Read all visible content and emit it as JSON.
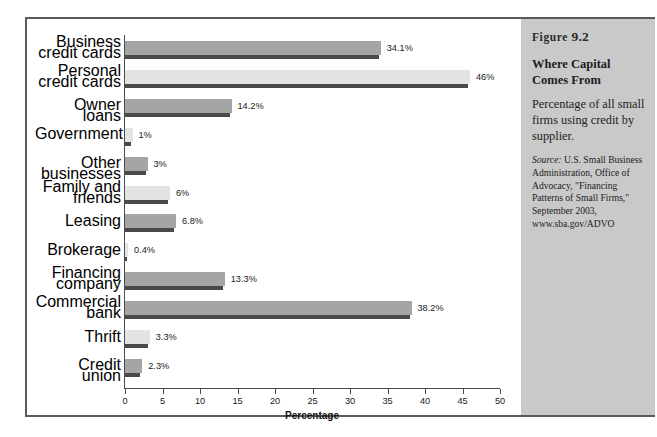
{
  "figure": {
    "number_word": "Figure",
    "number": "9.2",
    "title": "Where Capital Comes From",
    "description": "Percentage of all small firms using credit by supplier.",
    "source_word": "Source:",
    "source_text": " U.S. Small Business Administration, Office of Advocacy, \"Financing Patterns of Small Firms,\" September 2003, www.sba.gov/ADVO"
  },
  "colors": {
    "bar_dark": "#a5a5a5",
    "bar_light": "#e3e3e3",
    "bar_shadow": "#4a4a4a",
    "panel_bg": "#c9c9c9",
    "frame": "#5a5a5a",
    "axis": "#4b4b4b",
    "text": "#1a1a1a"
  },
  "chart_data": {
    "type": "bar",
    "orientation": "horizontal",
    "title": "Where Capital Comes From",
    "xlabel": "Percentage",
    "ylabel": "",
    "xlim": [
      0,
      50
    ],
    "xticks": [
      0,
      5,
      10,
      15,
      20,
      25,
      30,
      35,
      40,
      45,
      50
    ],
    "xtick_labels": [
      "0",
      "5",
      "10",
      "15",
      "20",
      "25",
      "30",
      "35",
      "40",
      "45",
      "50"
    ],
    "grid": false,
    "legend": "none",
    "categories": [
      "Business credit cards",
      "Personal credit cards",
      "Owner loans",
      "Government",
      "Other businesses",
      "Family and friends",
      "Leasing",
      "Brokerage",
      "Financing company",
      "Commercial bank",
      "Thrift",
      "Credit union"
    ],
    "values": [
      34.1,
      46,
      14.2,
      1,
      3,
      6,
      6.8,
      0.4,
      13.3,
      38.2,
      3.3,
      2.3
    ],
    "value_labels": [
      "34.1%",
      "46%",
      "14.2%",
      "1%",
      "3%",
      "6%",
      "6.8%",
      "0.4%",
      "13.3%",
      "38.2%",
      "3.3%",
      "2.3%"
    ],
    "bar_shades": [
      "dark",
      "light",
      "dark",
      "light",
      "dark",
      "light",
      "dark",
      "light",
      "dark",
      "dark",
      "light",
      "dark"
    ],
    "category_lines": [
      [
        "Business",
        "credit cards"
      ],
      [
        "Personal",
        "credit cards"
      ],
      [
        "Owner loans"
      ],
      [
        "Government"
      ],
      [
        "Other businesses"
      ],
      [
        "Family and",
        "friends"
      ],
      [
        "Leasing"
      ],
      [
        "Brokerage"
      ],
      [
        "Financing",
        "company"
      ],
      [
        "Commercial",
        "bank"
      ],
      [
        "Thrift"
      ],
      [
        "Credit union"
      ]
    ]
  }
}
